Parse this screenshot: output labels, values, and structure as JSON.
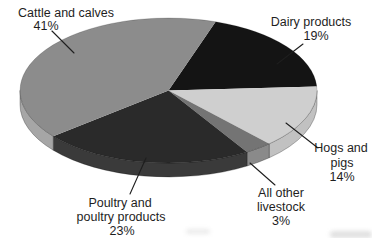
{
  "figure": {
    "background_color": "#ffffff",
    "text_color": "#1e1e1e",
    "leader_line_color": "#1e1e1e"
  },
  "chart_data": {
    "type": "pie",
    "title": "",
    "categories": [
      "Cattle and calves",
      "Dairy products",
      "Hogs and pigs",
      "All other livestock",
      "Poultry and poultry products"
    ],
    "values": [
      41,
      19,
      14,
      3,
      23
    ],
    "unit": "%",
    "legend_position": "none",
    "style": "3d-extruded-ellipse",
    "layout": {
      "cx": 168.5,
      "cy": 90.5,
      "rx": 148.5,
      "ry": 72.5,
      "depth": 14,
      "start_angle_deg": 288.5,
      "direction": "clockwise"
    },
    "slices": [
      {
        "name": "Dairy products",
        "pct": 19,
        "color_top": "#141414",
        "color_side": "#242424",
        "label_lines": [
          {
            "text": "Dairy products",
            "x": 311,
            "y": 26
          },
          {
            "text": "19%",
            "x": 316,
            "y": 40
          }
        ],
        "leader": {
          "x1": 303,
          "y1": 44,
          "x2": 277,
          "y2": 64
        }
      },
      {
        "name": "Hogs and pigs",
        "pct": 14,
        "color_top": "#cfcfcf",
        "color_side": "#c1c1c1",
        "label_lines": [
          {
            "text": "Hogs and",
            "x": 341,
            "y": 152
          },
          {
            "text": "pigs",
            "x": 342,
            "y": 167
          },
          {
            "text": "14%",
            "x": 342,
            "y": 181
          }
        ],
        "leader": {
          "x1": 318,
          "y1": 148,
          "x2": 286,
          "y2": 123
        }
      },
      {
        "name": "All other livestock",
        "pct": 3,
        "color_top": "#747474",
        "color_side": "#8a8a8a",
        "label_lines": [
          {
            "text": "All other",
            "x": 281,
            "y": 197
          },
          {
            "text": "livestock",
            "x": 281,
            "y": 211
          },
          {
            "text": "3%",
            "x": 281,
            "y": 225
          }
        ],
        "leader": {
          "x1": 275,
          "y1": 185,
          "x2": 250,
          "y2": 163
        }
      },
      {
        "name": "Poultry and poultry products",
        "pct": 23,
        "color_top": "#2a2a2a",
        "color_side": "#3a3a3a",
        "label_lines": [
          {
            "text": "Poultry and",
            "x": 120,
            "y": 207
          },
          {
            "text": "poultry products",
            "x": 121,
            "y": 221
          },
          {
            "text": "23%",
            "x": 122,
            "y": 235
          }
        ],
        "leader": {
          "x1": 130,
          "y1": 194,
          "x2": 146,
          "y2": 158
        }
      },
      {
        "name": "Cattle and calves",
        "pct": 41,
        "color_top": "#8c8c8c",
        "color_side": "#a6a6a6",
        "label_lines": [
          {
            "text": "Cattle and calves",
            "x": 66,
            "y": 17
          },
          {
            "text": "41%",
            "x": 46,
            "y": 30
          }
        ],
        "leader": {
          "x1": 52,
          "y1": 31,
          "x2": 74,
          "y2": 53
        }
      }
    ]
  }
}
